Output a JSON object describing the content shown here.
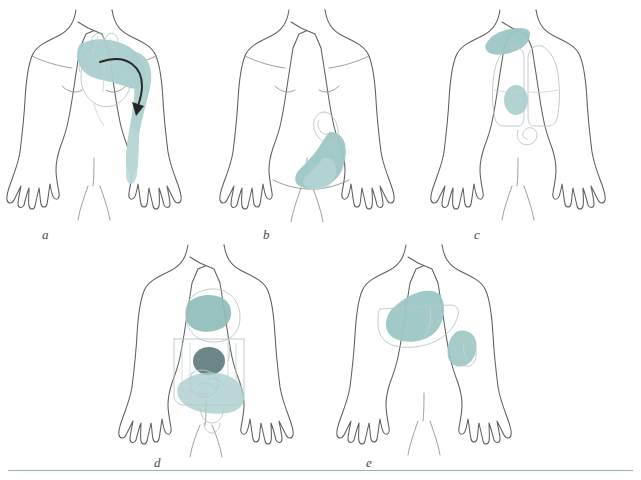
{
  "figure": {
    "type": "medical-illustration",
    "panel_count": 5,
    "layout": "two rows: three panels on top, two panels on bottom",
    "separator_rule_color": "#8fb3b6",
    "background": "#ffffff"
  },
  "palette": {
    "pain_light": "#bcd7d6",
    "pain_medium": "#9cc6c4",
    "pain_strong": "#86b6b4",
    "pain_dark": "#5f7d7d",
    "body_outline": "#5d5d5d",
    "body_detail": "#8e8e8e",
    "organ_outline": "#b9c6c7",
    "arrow": "#262626",
    "label_text": "#4a4a4a"
  },
  "panels": [
    {
      "id": "a",
      "label": "a",
      "organ": "heart",
      "description": "Cardiac referred pain radiating from the chest across the left shoulder and down the inner left arm",
      "pain_regions": [
        "left precordium / upper chest",
        "left shoulder and axilla",
        "medial left arm to forearm"
      ],
      "has_arrow": true,
      "arrow_direction": "from chest laterally then downward along the arm",
      "organ_outlines": [
        "heart",
        "great vessels"
      ]
    },
    {
      "id": "b",
      "label": "b",
      "organ": "appendix",
      "description": "Appendiceal pain localising in the right lower quadrant as an oblique band toward the groin",
      "pain_regions": [
        "right lower quadrant",
        "right inguinal region"
      ],
      "has_arrow": false,
      "organ_outlines": [
        "appendix",
        "cecum"
      ]
    },
    {
      "id": "c",
      "label": "c",
      "organ": "lungs",
      "description": "Pulmonary and diaphragmatic pain referred to the shoulder tip with a localised chest spot",
      "pain_regions": [
        "right shoulder tip / trapezius ridge",
        "right mid-chest spot"
      ],
      "has_arrow": false,
      "organ_outlines": [
        "right lung",
        "left lung",
        "stomach"
      ]
    },
    {
      "id": "d",
      "label": "d",
      "organ": "gastrointestinal tract",
      "description": "Gut pain felt in the midline at three levels: epigastric, periumbilical and lower abdominal",
      "pain_regions": [
        "epigastrium (stomach)",
        "periumbilical region (most intense)",
        "lower abdomen (small and large intestine)"
      ],
      "has_arrow": false,
      "organ_outlines": [
        "stomach",
        "large intestine",
        "small intestine",
        "bladder"
      ]
    },
    {
      "id": "e",
      "label": "e",
      "organ": "liver and gallbladder",
      "description": "Hepatobiliary pain in the right upper quadrant with a separate left-sided organ spot",
      "pain_regions": [
        "right upper quadrant / liver bed",
        "left flank organ spot"
      ],
      "has_arrow": false,
      "organ_outlines": [
        "liver",
        "kidney"
      ]
    }
  ]
}
